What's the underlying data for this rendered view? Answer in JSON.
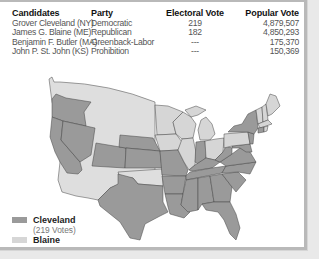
{
  "table": {
    "headers": {
      "candidates": "Candidates",
      "party": "Party",
      "electoral_vote": "Electoral Vote",
      "popular_vote": "Popular Vote"
    },
    "rows": [
      {
        "candidate": "Grover Cleveland (NY)",
        "party": "Democratic",
        "electoral_vote": "219",
        "popular_vote": "4,879,507"
      },
      {
        "candidate": "James G. Blaine (ME)",
        "party": "Republican",
        "electoral_vote": "182",
        "popular_vote": "4,850,293"
      },
      {
        "candidate": "Benjamin F. Butler (MA)",
        "party": "Greenback-Labor",
        "electoral_vote": "---",
        "popular_vote": "175,370"
      },
      {
        "candidate": "John P. St. John (KS)",
        "party": "Prohibition",
        "electoral_vote": "---",
        "popular_vote": "150,369"
      }
    ]
  },
  "legend": {
    "items": [
      {
        "label": "Cleveland",
        "sublabel": "(219 Votes)",
        "color": "#9a9a9a"
      },
      {
        "label": "Blaine",
        "sublabel": "",
        "color": "#d6d6d6"
      }
    ]
  },
  "map": {
    "territory_color": "#dedede",
    "cleveland_color": "#9a9a9a",
    "blaine_color": "#d6d6d6",
    "border_color": "#444444"
  }
}
